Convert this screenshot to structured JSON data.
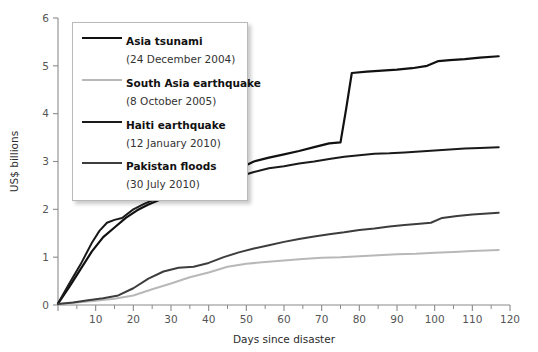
{
  "chart_data": {
    "type": "line",
    "title": "",
    "subtitle": "",
    "xlabel": "Days since disaster",
    "ylabel": "US$ billions",
    "xlim": [
      0,
      120
    ],
    "ylim": [
      0,
      6
    ],
    "xticks": [
      0,
      10,
      20,
      30,
      40,
      50,
      60,
      70,
      80,
      90,
      100,
      110,
      120
    ],
    "xtick_labels": [
      "",
      "10",
      "20",
      "30",
      "40",
      "50",
      "60",
      "70",
      "80",
      "90",
      "100",
      "110",
      "120"
    ],
    "xminor_ticks": [
      5,
      15,
      25,
      35,
      45,
      55,
      65,
      75,
      85,
      95,
      105,
      115
    ],
    "yticks": [
      0,
      1,
      2,
      3,
      4,
      5,
      6
    ],
    "ytick_labels": [
      "0",
      "1",
      "2",
      "3",
      "4",
      "5",
      "6"
    ],
    "grid": false,
    "legend_position": "upper-left",
    "series": [
      {
        "name": "Asia tsunami",
        "date": "(24 December 2004)",
        "legend_label": "Asia tsunami",
        "color": "#111111",
        "width": 2.2,
        "x": [
          0,
          3,
          6,
          9,
          12,
          15,
          18,
          21,
          24,
          27,
          30,
          33,
          36,
          39,
          42,
          45,
          48,
          52,
          56,
          60,
          64,
          68,
          72,
          75,
          76.5,
          78,
          82,
          86,
          90,
          94,
          98,
          101,
          104,
          108,
          112,
          117
        ],
        "y": [
          0.03,
          0.38,
          0.75,
          1.12,
          1.42,
          1.62,
          1.82,
          1.98,
          2.1,
          2.2,
          2.28,
          2.38,
          2.48,
          2.52,
          2.6,
          2.72,
          2.85,
          3.0,
          3.08,
          3.15,
          3.22,
          3.3,
          3.38,
          3.4,
          4.1,
          4.85,
          4.88,
          4.9,
          4.92,
          4.95,
          5.0,
          5.1,
          5.12,
          5.14,
          5.17,
          5.2
        ]
      },
      {
        "name": "South Asia earthquake",
        "date": "(8 October 2005)",
        "legend_label": "South Asia earthquake",
        "color": "#b8b8b8",
        "width": 2.0,
        "x": [
          0,
          5,
          10,
          15,
          20,
          25,
          30,
          35,
          40,
          45,
          50,
          55,
          60,
          65,
          70,
          75,
          80,
          85,
          90,
          95,
          100,
          105,
          110,
          117
        ],
        "y": [
          0.02,
          0.05,
          0.09,
          0.13,
          0.2,
          0.33,
          0.45,
          0.58,
          0.68,
          0.8,
          0.86,
          0.9,
          0.93,
          0.96,
          0.99,
          1.0,
          1.02,
          1.04,
          1.06,
          1.07,
          1.09,
          1.11,
          1.13,
          1.15
        ]
      },
      {
        "name": "Haiti earthquake",
        "date": "(12 January 2010)",
        "legend_label": "Haiti earthquake",
        "color": "#1a1a1a",
        "width": 2.0,
        "x": [
          0,
          3,
          6,
          9,
          11,
          13,
          15,
          17,
          20,
          23,
          26,
          29,
          32,
          34,
          36,
          40,
          44,
          48,
          52,
          56,
          60,
          64,
          68,
          72,
          76,
          80,
          84,
          88,
          92,
          96,
          100,
          104,
          108,
          112,
          117
        ],
        "y": [
          0.03,
          0.45,
          0.85,
          1.3,
          1.55,
          1.72,
          1.78,
          1.82,
          2.0,
          2.12,
          2.22,
          2.3,
          2.4,
          2.48,
          2.5,
          2.55,
          2.6,
          2.68,
          2.78,
          2.86,
          2.9,
          2.96,
          3.0,
          3.05,
          3.1,
          3.13,
          3.16,
          3.17,
          3.19,
          3.21,
          3.23,
          3.25,
          3.27,
          3.28,
          3.3
        ]
      },
      {
        "name": "Pakistan floods",
        "date": "(30 July 2010)",
        "legend_label": "Pakistan floods",
        "color": "#3d3d3d",
        "width": 2.0,
        "x": [
          0,
          4,
          8,
          12,
          16,
          20,
          24,
          28,
          32,
          36,
          40,
          44,
          48,
          52,
          56,
          60,
          64,
          68,
          72,
          76,
          80,
          84,
          88,
          92,
          96,
          99,
          102,
          106,
          110,
          117
        ],
        "y": [
          0.02,
          0.05,
          0.1,
          0.14,
          0.2,
          0.35,
          0.55,
          0.7,
          0.78,
          0.8,
          0.88,
          1.0,
          1.1,
          1.18,
          1.25,
          1.32,
          1.38,
          1.43,
          1.48,
          1.52,
          1.57,
          1.6,
          1.64,
          1.67,
          1.7,
          1.72,
          1.82,
          1.86,
          1.89,
          1.93
        ]
      }
    ]
  },
  "axes": {
    "ylabel": "US$ billions",
    "xlabel": "Days since disaster"
  },
  "legend": {
    "items": [
      {
        "name": "Asia tsunami",
        "date": "(24 December 2004)"
      },
      {
        "name": "South Asia earthquake",
        "date": "(8 October 2005)"
      },
      {
        "name": "Haiti earthquake",
        "date": "(12 January 2010)"
      },
      {
        "name": "Pakistan floods",
        "date": "(30 July 2010)"
      }
    ]
  }
}
